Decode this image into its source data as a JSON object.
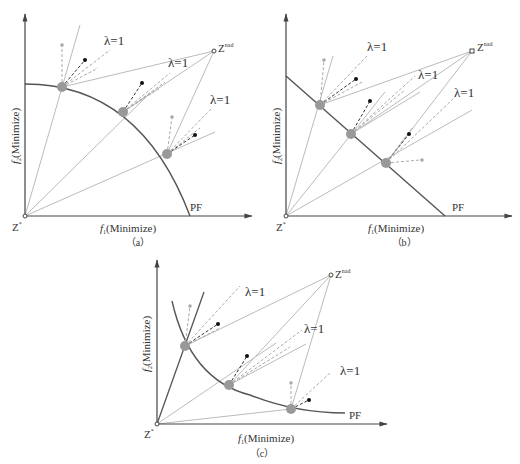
{
  "figure": {
    "panels": [
      {
        "id": "a",
        "caption": "（a）",
        "x_label": "f",
        "x_label_sub": "1",
        "x_label_suffix": "(Minimize)",
        "y_label": "f",
        "y_label_sub": "2",
        "y_label_suffix": "(Minimize)",
        "origin_label": "Z",
        "origin_sup": "*",
        "nadir_label": "Z",
        "nadir_sup": "nad",
        "front_label": "PF",
        "front_shape": "concave-arc",
        "lambda_labels": [
          "λ=1",
          "λ=1",
          "λ=1"
        ]
      },
      {
        "id": "b",
        "caption": "（b）",
        "x_label": "f",
        "x_label_sub": "1",
        "x_label_suffix": "(Minimize)",
        "y_label": "f",
        "y_label_sub": "2",
        "y_label_suffix": "(Minimize)",
        "origin_label": "Z",
        "origin_sup": "*",
        "nadir_label": "Z",
        "nadir_sup": "nad",
        "front_label": "PF",
        "front_shape": "linear",
        "lambda_labels": [
          "λ=1",
          "λ=1",
          "λ=1"
        ]
      },
      {
        "id": "c",
        "caption": "（c）",
        "x_label": "f",
        "x_label_sub": "1",
        "x_label_suffix": "(Minimize)",
        "y_label": "f",
        "y_label_sub": "2",
        "y_label_suffix": "(Minimize)",
        "origin_label": "Z",
        "origin_sup": "*",
        "nadir_label": "Z",
        "nadir_sup": "nad",
        "front_label": "PF",
        "front_shape": "convex-curve",
        "lambda_labels": [
          "λ=1",
          "λ=1",
          "λ=1"
        ]
      }
    ],
    "colors": {
      "axis": "#444444",
      "front": "#555555",
      "ray": "#bbbbbb",
      "dashed_dark": "#333333",
      "dashed_light": "#aaaaaa",
      "solution_point": "#999999",
      "dot_dark": "#111111",
      "dot_light": "#aaaaaa"
    }
  }
}
